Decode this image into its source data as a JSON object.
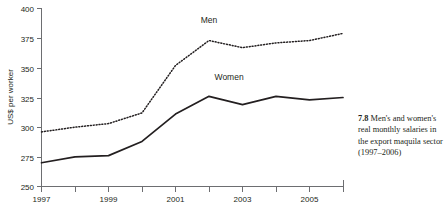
{
  "figure": {
    "caption_number": "7.8",
    "caption_text": "Men's and women's real monthly salaries in the export maquila sector (1997–2006)"
  },
  "chart_data": {
    "type": "line",
    "title": "",
    "xlabel": "",
    "ylabel": "US$ per worker",
    "xlim": [
      1997,
      2006
    ],
    "ylim": [
      250,
      400
    ],
    "grid": false,
    "legend": "inline-labels",
    "x": [
      1997,
      1998,
      1999,
      2000,
      2001,
      2002,
      2003,
      2004,
      2005,
      2006
    ],
    "xticks": [
      1997,
      1998,
      1999,
      2000,
      2001,
      2002,
      2003,
      2004,
      2005,
      2006
    ],
    "xticklabels": [
      "1997",
      "",
      "1999",
      "",
      "2001",
      "",
      "2003",
      "",
      "2005",
      ""
    ],
    "yticks": [
      250,
      275,
      300,
      325,
      350,
      375,
      400
    ],
    "yticklabels": [
      "250",
      "275",
      "300",
      "325",
      "350",
      "375",
      "400"
    ],
    "series": [
      {
        "name": "Men",
        "style": "dotted",
        "values": [
          296,
          300,
          303,
          312,
          352,
          373,
          367,
          371,
          373,
          379
        ]
      },
      {
        "name": "Women",
        "style": "solid",
        "values": [
          270,
          275,
          276,
          288,
          311,
          326,
          319,
          326,
          323,
          325
        ]
      }
    ],
    "annotations": [
      {
        "text": "Men",
        "x": 2002,
        "y": 388
      },
      {
        "text": "Women",
        "x": 2002.6,
        "y": 340
      }
    ]
  }
}
